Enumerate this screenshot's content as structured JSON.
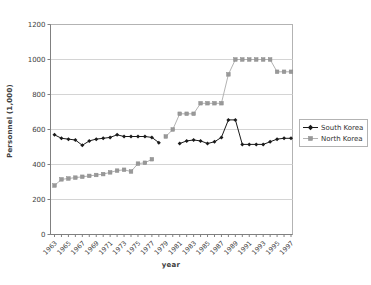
{
  "chart_data": {
    "type": "line",
    "title": "",
    "xlabel": "year",
    "ylabel": "Personnel (1,000)",
    "ylim": [
      0,
      1200
    ],
    "yticks": [
      0,
      200,
      400,
      600,
      800,
      1000,
      1200
    ],
    "grid": "horizontal",
    "legend_position": "right",
    "x": [
      1963,
      1964,
      1965,
      1966,
      1967,
      1968,
      1969,
      1970,
      1971,
      1972,
      1973,
      1974,
      1975,
      1976,
      1977,
      1978,
      1979,
      1980,
      1981,
      1982,
      1983,
      1984,
      1985,
      1986,
      1987,
      1988,
      1989,
      1990,
      1991,
      1992,
      1993,
      1994,
      1995,
      1996,
      1997
    ],
    "xtick_labels": [
      "1963",
      "1965",
      "1967",
      "1969",
      "1971",
      "1973",
      "1975",
      "1977",
      "1979",
      "1981",
      "1983",
      "1985",
      "1987",
      "1989",
      "1991",
      "1993",
      "1995",
      "1997"
    ],
    "series": [
      {
        "name": "South Korea",
        "color": "#1a1a1a",
        "marker": "diamond",
        "marker_color": "#1a1a1a",
        "values": [
          570,
          550,
          545,
          540,
          510,
          535,
          545,
          550,
          555,
          570,
          560,
          560,
          560,
          560,
          555,
          525,
          null,
          null,
          520,
          535,
          540,
          535,
          520,
          530,
          555,
          655,
          655,
          515,
          515,
          515,
          515,
          530,
          545,
          550,
          550
        ]
      },
      {
        "name": "North Korea",
        "color": "#b3b3b3",
        "marker": "square",
        "marker_color": "#999999",
        "values": [
          280,
          315,
          320,
          325,
          330,
          335,
          340,
          345,
          355,
          365,
          370,
          360,
          405,
          410,
          430,
          null,
          560,
          600,
          690,
          690,
          690,
          750,
          750,
          750,
          750,
          915,
          1000,
          1000,
          1000,
          1000,
          1000,
          1000,
          930,
          930,
          930
        ]
      }
    ]
  },
  "colors": {
    "grid": "#d4d4d4",
    "plot_border": "#b3b3b3",
    "axis": "#808080",
    "tick_text": "#404040",
    "background": "#ffffff"
  }
}
